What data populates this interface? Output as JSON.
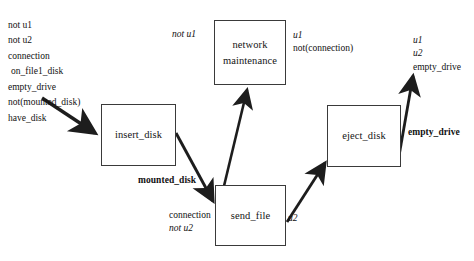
{
  "diagram": {
    "background": "#ffffff",
    "stroke": "#222222",
    "nodes": [
      {
        "id": "insert_disk",
        "label": "insert_disk",
        "lines": [
          "insert_disk"
        ],
        "x": 101,
        "y": 104,
        "w": 75,
        "h": 62
      },
      {
        "id": "network_maintenance",
        "label": "network maintenance",
        "lines": [
          "network",
          "maintenance"
        ],
        "x": 214,
        "y": 20,
        "w": 72,
        "h": 65
      },
      {
        "id": "send_file",
        "label": "send_file",
        "lines": [
          "send_file"
        ],
        "x": 215,
        "y": 185,
        "w": 71,
        "h": 61
      },
      {
        "id": "eject_disk",
        "label": "eject_disk",
        "lines": [
          "eject_disk"
        ],
        "x": 327,
        "y": 105,
        "w": 74,
        "h": 62
      }
    ],
    "initial_conditions": {
      "name": "initial-state-conditions",
      "rows": [
        {
          "text": "not u1",
          "italic": true,
          "indent": false
        },
        {
          "text": "not u2",
          "italic": true,
          "indent": false
        },
        {
          "text": "connection",
          "italic": false,
          "indent": false
        },
        {
          "text": "on_file1_disk",
          "italic": false,
          "indent": true
        },
        {
          "text": "empty_drive",
          "italic": false,
          "indent": false
        },
        {
          "text": "not(mounted_disk)",
          "italic": false,
          "indent": false
        },
        {
          "text": "have_disk",
          "italic": false,
          "indent": false
        }
      ]
    },
    "labels": [
      {
        "id": "network-precondition",
        "rows": [
          {
            "text": "not u1",
            "italic": true
          }
        ],
        "bold": false,
        "x": 172,
        "y": 28
      },
      {
        "id": "network-effect",
        "rows": [
          {
            "text": "u1",
            "italic": true
          },
          {
            "text": "not(connection)",
            "italic": false
          }
        ],
        "bold": false,
        "x": 293,
        "y": 29
      },
      {
        "id": "mounted-disk-edge-label",
        "rows": [
          {
            "text": "mounted_disk",
            "italic": false
          }
        ],
        "bold": true,
        "x": 138,
        "y": 174
      },
      {
        "id": "send-file-precondition",
        "rows": [
          {
            "text": "connection",
            "italic": false
          },
          {
            "text": "not u2",
            "italic": true
          }
        ],
        "bold": false,
        "x": 169,
        "y": 209
      },
      {
        "id": "send-file-effect",
        "rows": [
          {
            "text": "u2",
            "italic": true
          }
        ],
        "bold": false,
        "x": 288,
        "y": 212
      },
      {
        "id": "eject-disk-edge-label",
        "rows": [
          {
            "text": "empty_drive",
            "italic": false
          }
        ],
        "bold": true,
        "x": 408,
        "y": 126
      },
      {
        "id": "goal-state",
        "rows": [
          {
            "text": "u1",
            "italic": true
          },
          {
            "text": "u2",
            "italic": true
          },
          {
            "text": "empty_drive",
            "italic": false
          }
        ],
        "bold": false,
        "x": 413,
        "y": 34
      }
    ],
    "edges": [
      {
        "id": "start-to-insert-disk",
        "from": "initial-conditions",
        "to": "insert_disk"
      },
      {
        "id": "insert-disk-to-send-file",
        "from": "insert_disk",
        "to": "send_file",
        "label": "mounted_disk"
      },
      {
        "id": "send-file-to-network-maintenance",
        "from": "send_file",
        "to": "network_maintenance"
      },
      {
        "id": "send-file-to-eject-disk",
        "from": "send_file",
        "to": "eject_disk",
        "label": "u2"
      },
      {
        "id": "eject-disk-to-goal",
        "from": "eject_disk",
        "to": "goal-state",
        "label": "empty_drive"
      }
    ]
  }
}
